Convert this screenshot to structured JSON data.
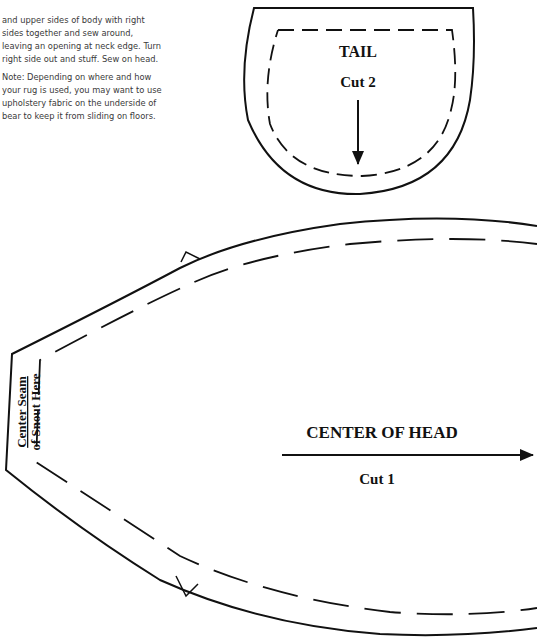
{
  "instructions": {
    "paragraphs": [
      "and upper sides of body with right sides together and sew around, leaving an opening at neck edge. Turn right side out and stuff. Sew on head.",
      "Note: Depending on where and how your rug is used, you may want to use upholstery fabric on the underside of bear to keep it from sliding on floors."
    ]
  },
  "tail_piece": {
    "title": "TAIL",
    "cut": "Cut 2",
    "arrow": "grain-arrow-down"
  },
  "head_piece": {
    "title": "CENTER OF HEAD",
    "cut": "Cut 1",
    "arrow": "grain-arrow-right",
    "snout_label_line1": "Center Seam",
    "snout_label_line2": "of Snout Here",
    "notches": [
      "top-notch",
      "bottom-notch"
    ]
  },
  "colors": {
    "line": "#111111",
    "text": "#3a3a3a",
    "background": "#ffffff"
  }
}
